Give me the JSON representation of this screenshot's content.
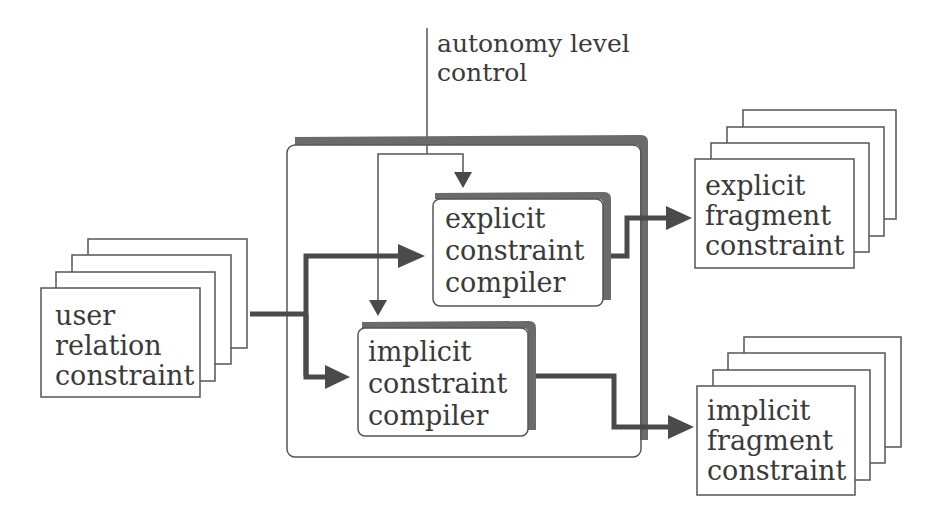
{
  "diagram": {
    "control": {
      "line1": "autonomy level",
      "line2": "control"
    },
    "input_stack": {
      "line1": "user",
      "line2": "relation",
      "line3": "constraint"
    },
    "explicit_compiler": {
      "line1": "explicit",
      "line2": "constraint",
      "line3": "compiler"
    },
    "implicit_compiler": {
      "line1": "implicit",
      "line2": "constraint",
      "line3": "compiler"
    },
    "explicit_output": {
      "line1": "explicit",
      "line2": "fragment",
      "line3": "constraint"
    },
    "implicit_output": {
      "line1": "implicit",
      "line2": "fragment",
      "line3": "constraint"
    },
    "colors": {
      "stroke": "#555555",
      "thick_arrow": "#4a4a4a",
      "shadow": "#6b6b6b",
      "background": "#ffffff"
    }
  }
}
